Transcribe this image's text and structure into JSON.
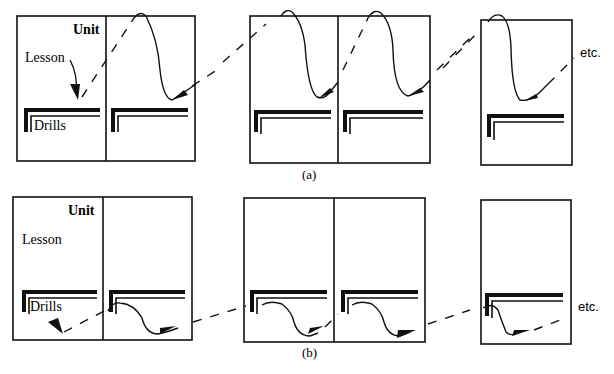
{
  "diagram": {
    "panels": [
      {
        "id": "a",
        "caption": "(a)",
        "labels": {
          "unit": "Unit",
          "lesson": "Lesson",
          "drills": "Drills",
          "continuation": "etc."
        },
        "description": "Path goes from lesson area of one unit, dashed to top of next unit, curves down through lesson area and arrives just above the drills region; drills are skipped."
      },
      {
        "id": "b",
        "caption": "(b)",
        "labels": {
          "unit": "Unit",
          "lesson": "Lesson",
          "drills": "Drills",
          "continuation": "etc."
        },
        "description": "Path goes through the drills region of each unit, dashed connection into the drills of the next unit, lesson area skipped."
      }
    ],
    "colors": {
      "ink": "#111111",
      "paper": "#ffffff"
    }
  }
}
